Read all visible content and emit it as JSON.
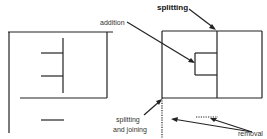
{
  "labels": {
    "addition": "addition",
    "splitting": "splitting",
    "splitting_and_joining_line1": "splitting",
    "splitting_and_joining_line2": "and joining",
    "removal": "removal"
  },
  "colors": {
    "line": "#222222",
    "background": "#ffffff"
  }
}
